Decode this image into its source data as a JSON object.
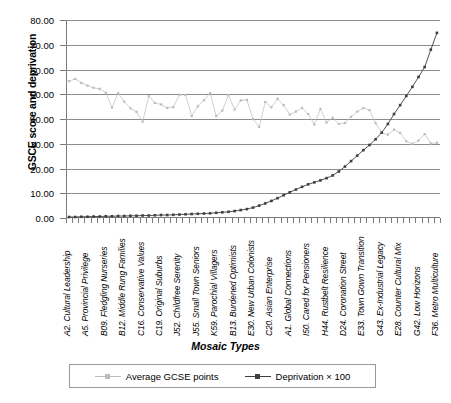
{
  "chart_data": {
    "type": "line",
    "title": "",
    "xlabel": "Mosaic Types",
    "ylabel": "GSCE score and deprivation",
    "ylim": [
      0,
      80
    ],
    "ytick_labels": [
      "80.00",
      "70.00",
      "60.00",
      "50.00",
      "40.00",
      "30.00",
      "20.00",
      "10.00",
      "0.00"
    ],
    "ytick_values": [
      80,
      70,
      60,
      50,
      40,
      30,
      20,
      10,
      0
    ],
    "grid": "horizontal",
    "legend_position": "bottom",
    "n_categories": 61,
    "categories": [
      "A2. Cultural Leadership",
      "",
      "",
      "A5. Provincial Privilege",
      "",
      "",
      "B09. Fledgling Nurseries",
      "",
      "",
      "B12. Middle Rung Families",
      "",
      "",
      "C16. Conservative Values",
      "",
      "",
      "C19. Original Suburbs",
      "",
      "",
      "J52. Childfree Serenity",
      "",
      "",
      "J55. Small Town Seniors",
      "",
      "",
      "K59. Parochial Villagers",
      "",
      "",
      "B13. Burdened Optimists",
      "",
      "",
      "E30. New Urban Colonists",
      "",
      "",
      "C20. Asian Enterprise",
      "",
      "",
      "A1. Global Connections",
      "",
      "",
      "I50. Cared for Pensioners",
      "",
      "",
      "H44. Rustbelt Resilience",
      "",
      "",
      "D24. Coronation Street",
      "",
      "",
      "E33. Town Gown Transition",
      "",
      "",
      "G43. Ex-Industrial Legacy",
      "",
      "",
      "E28. Counter Cultural Mix",
      "",
      "",
      "G42. Low Horizons",
      "",
      "",
      "F36. Metro Multiculture"
    ],
    "visible_tick_labels": [
      "A2. Cultural Leadership",
      "A5. Provincial Privilege",
      "B09. Fledgling Nurseries",
      "B12. Middle Rung Families",
      "C16. Conservative Values",
      "C19. Original Suburbs",
      "J52. Childfree Serenity",
      "J55. Small Town Seniors",
      "K59. Parochial Villagers",
      "B13. Burdened Optimists",
      "E30. New Urban Colonists",
      "C20. Asian Enterprise",
      "A1. Global Connections",
      "I50. Cared for Pensioners",
      "H44. Rustbelt Resilience",
      "D24. Coronation Street",
      "E33. Town Gown Transition",
      "G43. Ex-Industrial Legacy",
      "E28. Counter Cultural Mix",
      "G42. Low Horizons",
      "F36. Metro Multiculture"
    ],
    "series": [
      {
        "name": "Average GCSE points",
        "color": "#bcbcbc",
        "marker": "square",
        "values": [
          55.3,
          56.2,
          54.6,
          53.5,
          52.6,
          52.2,
          50.6,
          44.6,
          50.5,
          47.0,
          44.3,
          42.9,
          38.9,
          49.3,
          46.5,
          45.9,
          44.5,
          44.8,
          49.8,
          49.7,
          41.2,
          45.1,
          47.6,
          50.5,
          41.2,
          43.4,
          49.7,
          43.8,
          47.5,
          47.7,
          40.0,
          36.8,
          46.9,
          44.7,
          48.2,
          45.6,
          41.8,
          43.0,
          44.5,
          42.0,
          37.8,
          44.1,
          38.6,
          40.5,
          38.0,
          38.4,
          40.9,
          43.0,
          44.4,
          43.6,
          38.3,
          34.4,
          33.7,
          35.7,
          34.4,
          31.0,
          30.0,
          31.3,
          33.9,
          30.1,
          30.4
        ]
      },
      {
        "name": "Deprivation × 100",
        "color": "#3f3f3f",
        "marker": "square",
        "values": [
          0.4,
          0.4,
          0.5,
          0.5,
          0.6,
          0.6,
          0.7,
          0.7,
          0.8,
          0.8,
          0.9,
          0.9,
          1.0,
          1.0,
          1.1,
          1.2,
          1.2,
          1.3,
          1.4,
          1.5,
          1.6,
          1.7,
          1.8,
          1.9,
          2.1,
          2.3,
          2.5,
          2.8,
          3.2,
          3.6,
          4.2,
          5.0,
          5.9,
          6.9,
          8.0,
          9.2,
          10.4,
          11.5,
          12.6,
          13.6,
          14.4,
          15.2,
          16.1,
          17.2,
          18.8,
          20.8,
          23.0,
          25.2,
          27.4,
          29.5,
          31.8,
          34.5,
          38.0,
          42.0,
          45.6,
          49.3,
          53.0,
          57.0,
          61.0,
          68.0,
          74.8
        ]
      }
    ]
  },
  "legend": {
    "entries": [
      {
        "label": "Average GCSE points"
      },
      {
        "label": "Deprivation × 100"
      }
    ]
  }
}
